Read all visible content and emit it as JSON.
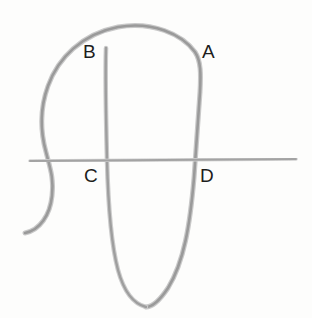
{
  "figure": {
    "background_color": "#fdfdfc",
    "stroke_color": "#a0a0a0",
    "stroke_color_dark": "#8d8d8d",
    "stroke_width": 2.6,
    "label_color": "#1d1d1d",
    "label_font_size": 19
  },
  "labels": [
    {
      "id": "A",
      "text": "A",
      "x": 202,
      "y": 42
    },
    {
      "id": "B",
      "text": "B",
      "x": 83,
      "y": 42
    },
    {
      "id": "C",
      "text": "C",
      "x": 84,
      "y": 166
    },
    {
      "id": "D",
      "text": "D",
      "x": 200,
      "y": 166
    }
  ],
  "chart_data": {
    "type": "line",
    "xlabel": "",
    "ylabel": "",
    "xlim": [
      0,
      312
    ],
    "ylim": [
      0,
      318
    ],
    "grid": false,
    "legend": "none",
    "annotations": [
      {
        "label": "A",
        "x": 202,
        "y": 50,
        "note": "upper right crossing region"
      },
      {
        "label": "B",
        "x": 89,
        "y": 50,
        "note": "upper left, tip of inner stroke"
      },
      {
        "label": "C",
        "x": 90,
        "y": 174,
        "note": "below horizontal line, left of inner stroke"
      },
      {
        "label": "D",
        "x": 206,
        "y": 174,
        "note": "below horizontal line, right of outer stroke"
      }
    ],
    "series": [
      {
        "name": "outer-loop",
        "description": "Large arch: rises from lower-left tail, bulges left, arcs over the top, descends on the right and sweeps left into the bottom U.",
        "path": "M 25 233 C 40 230 50 215 52 196 C 54 178 50 168 46 152 C 40 130 40 108 48 86 C 58 58 82 34 118 27 C 152 21 182 34 195 52 C 201 61 201 74 200 92 C 198 120 196 150 194 178 C 190 225 184 262 168 288 C 160 300 152 307 146 307",
        "points": [
          [
            25,
            233
          ],
          [
            36,
            231
          ],
          [
            46,
            222
          ],
          [
            52,
            205
          ],
          [
            52,
            190
          ],
          [
            48,
            172
          ],
          [
            45,
            156
          ],
          [
            42,
            138
          ],
          [
            41,
            120
          ],
          [
            44,
            100
          ],
          [
            52,
            80
          ],
          [
            66,
            58
          ],
          [
            86,
            40
          ],
          [
            110,
            29
          ],
          [
            134,
            26
          ],
          [
            158,
            29
          ],
          [
            178,
            38
          ],
          [
            191,
            50
          ],
          [
            199,
            63
          ],
          [
            200,
            80
          ],
          [
            199,
            100
          ],
          [
            197,
            122
          ],
          [
            195,
            146
          ],
          [
            194,
            166
          ],
          [
            192,
            190
          ],
          [
            189,
            214
          ],
          [
            184,
            240
          ],
          [
            177,
            264
          ],
          [
            168,
            285
          ],
          [
            158,
            299
          ],
          [
            148,
            306
          ]
        ]
      },
      {
        "name": "inner-stroke",
        "description": "Nearly vertical stroke starting just below B, running down and curving right to meet the bottom of the U.",
        "path": "M 106 48 C 105 80 106 120 107 160 C 108 200 110 240 118 270 C 124 292 134 304 146 307",
        "points": [
          [
            106,
            48
          ],
          [
            105,
            66
          ],
          [
            105,
            86
          ],
          [
            106,
            108
          ],
          [
            107,
            130
          ],
          [
            107,
            152
          ],
          [
            108,
            174
          ],
          [
            109,
            196
          ],
          [
            111,
            218
          ],
          [
            114,
            240
          ],
          [
            119,
            262
          ],
          [
            126,
            283
          ],
          [
            135,
            298
          ],
          [
            146,
            307
          ]
        ]
      },
      {
        "name": "horizontal-line",
        "description": "Straight horizontal line crossing the figure slightly below center.",
        "path": "M 30 161 L 296 159",
        "points": [
          [
            30,
            161
          ],
          [
            296,
            159
          ]
        ]
      }
    ]
  }
}
